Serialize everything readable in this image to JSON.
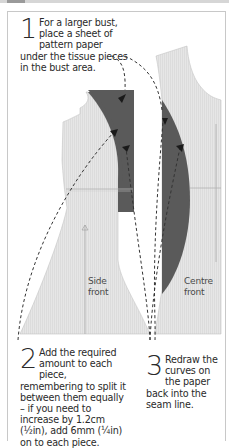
{
  "steps": [
    {
      "number": "1",
      "text": "For a larger bust, place a sheet of pattern paper under the tissue pieces in the bust area."
    },
    {
      "number": "2",
      "text": "Add the required amount to each piece, remembering to split it between them equally – if you need to increase by 1.2cm (½in), add 6mm (¼in) on to each piece."
    },
    {
      "number": "3",
      "text": "Redraw the curves on the paper back into the seam line."
    }
  ],
  "labels": {
    "side_front": [
      "Side",
      "front"
    ],
    "centre_front": [
      "Centre",
      "front"
    ]
  },
  "colors": {
    "tissue": "#e4e4e4",
    "added_paper": "#5a5a5a",
    "text": "#2a2a2a",
    "frame_border": "#c8c8c8"
  }
}
